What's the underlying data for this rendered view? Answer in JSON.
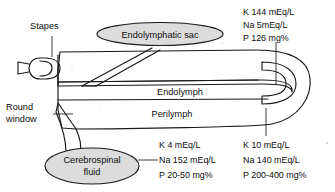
{
  "diagram": {
    "colors": {
      "fill_light": "#dcdcdc",
      "fill_duct": "#d2d2d2",
      "fill_white": "#ffffff",
      "stroke": "#1a1a1a",
      "background": "#ffffff"
    },
    "labels": {
      "stapes": "Stapes",
      "round_window_line1": "Round",
      "round_window_line2": "window",
      "endolymphatic_sac": "Endolymphatic sac",
      "endolymph": "Endolymph",
      "perilymph": "Perilymph",
      "csf_line1": "Cerebrospinal",
      "csf_line2": "fluid"
    },
    "composition_blocks": {
      "endolymph": {
        "position": "top-right",
        "lines": [
          "K 144 mEq/L",
          "Na 5mEq/L",
          "P 126 mg%"
        ]
      },
      "csf": {
        "position": "bottom-left",
        "lines": [
          "K 4 mEq/L",
          "Na 152 mEq/L",
          "P 20-50 mg%"
        ]
      },
      "perilymph": {
        "position": "bottom-right",
        "lines": [
          "K 10 mEq/L",
          "Na 140 mEq/L",
          "P 200-400 mg%"
        ]
      }
    }
  }
}
